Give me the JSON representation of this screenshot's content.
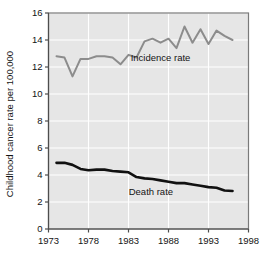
{
  "chart_data": {
    "type": "line",
    "title": "",
    "subtitle": "",
    "xlabel": "",
    "ylabel": "Childhood cancer rate per 100,000",
    "xlim": [
      1973,
      1998
    ],
    "ylim": [
      0,
      16
    ],
    "xticks": [
      1973,
      1978,
      1983,
      1988,
      1993,
      1998
    ],
    "xtick_labels": [
      "1973",
      "1978",
      "1983",
      "1988",
      "1993",
      "1998"
    ],
    "yticks": [
      0,
      2,
      4,
      6,
      8,
      10,
      12,
      14,
      16
    ],
    "ytick_labels": [
      "0",
      "2",
      "4",
      "6",
      "8",
      "10",
      "12",
      "14",
      "16"
    ],
    "grid": true,
    "grid_color": "#ffffff",
    "plot_background": "#e6e6e6",
    "legend_position": "inline-annotation",
    "series": [
      {
        "name": "Incidence rate",
        "color": "#8c8c8c",
        "line_width": 2.0,
        "annotation": "Incidence rate",
        "annotation_x": 1987.0,
        "annotation_y": 12.45,
        "x": [
          1974,
          1975,
          1976,
          1977,
          1978,
          1979,
          1980,
          1981,
          1982,
          1983,
          1984,
          1985,
          1986,
          1987,
          1988,
          1989,
          1990,
          1991,
          1992,
          1993,
          1994,
          1995,
          1996
        ],
        "values": [
          12.8,
          12.7,
          11.3,
          12.6,
          12.6,
          12.8,
          12.8,
          12.7,
          12.2,
          12.9,
          12.7,
          13.9,
          14.1,
          13.8,
          14.1,
          13.4,
          15.0,
          13.8,
          14.8,
          13.7,
          14.7,
          14.3,
          14.0
        ]
      },
      {
        "name": "Death rate",
        "color": "#111111",
        "line_width": 2.6,
        "annotation": "Death rate",
        "annotation_x": 1985.8,
        "annotation_y": 2.55,
        "x": [
          1974,
          1975,
          1976,
          1977,
          1978,
          1979,
          1980,
          1981,
          1982,
          1983,
          1984,
          1985,
          1986,
          1987,
          1988,
          1989,
          1990,
          1991,
          1992,
          1993,
          1994,
          1995,
          1996
        ],
        "values": [
          4.9,
          4.9,
          4.75,
          4.45,
          4.35,
          4.4,
          4.4,
          4.3,
          4.25,
          4.2,
          3.85,
          3.75,
          3.7,
          3.6,
          3.5,
          3.4,
          3.4,
          3.3,
          3.2,
          3.1,
          3.05,
          2.85,
          2.82
        ]
      }
    ]
  }
}
